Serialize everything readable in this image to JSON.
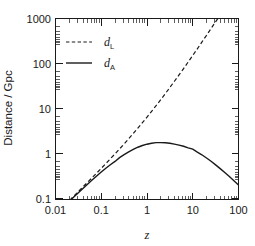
{
  "chart_data": {
    "type": "line",
    "title": "",
    "xlabel": "z",
    "ylabel": "Distance / Gpc",
    "xscale": "log",
    "yscale": "log",
    "xlim": [
      0.01,
      100
    ],
    "ylim": [
      0.04,
      1000
    ],
    "grid": false,
    "legend_position": "upper-left",
    "xticks": [
      0.01,
      0.1,
      1,
      10,
      100
    ],
    "xtick_labels": [
      "0.01",
      "0.1",
      "1",
      "10",
      "100"
    ],
    "yticks": [
      0.1,
      1,
      10,
      100,
      1000
    ],
    "ytick_labels": [
      "0.1",
      "1",
      "10",
      "100",
      "1000"
    ],
    "series": [
      {
        "name": "d_L",
        "label": "d",
        "label_sub": "L",
        "style": "dashed",
        "color": "#1a1a1a",
        "x": [
          0.01,
          0.0126,
          0.0158,
          0.02,
          0.0251,
          0.0316,
          0.0398,
          0.0501,
          0.0631,
          0.0794,
          0.1,
          0.126,
          0.158,
          0.2,
          0.251,
          0.316,
          0.398,
          0.501,
          0.631,
          0.794,
          1.0,
          1.26,
          1.58,
          2.0,
          2.51,
          3.16,
          3.98,
          5.01,
          6.31,
          7.94,
          10.0,
          12.6,
          15.8,
          20.0,
          25.1,
          31.6,
          39.8,
          50.1,
          63.1,
          79.4,
          100.0
        ],
        "y": [
          0.0447,
          0.0563,
          0.0709,
          0.0896,
          0.113,
          0.143,
          0.181,
          0.229,
          0.29,
          0.368,
          0.468,
          0.597,
          0.763,
          0.978,
          1.26,
          1.63,
          2.12,
          2.78,
          3.66,
          4.84,
          6.44,
          8.62,
          11.6,
          15.7,
          21.4,
          29.3,
          40.3,
          55.7,
          77.3,
          108.0,
          151.0,
          212.0,
          299.0,
          422.0,
          597.0,
          845.0,
          1197.0,
          1697.0,
          2406.0,
          3413.0,
          4843.0
        ]
      },
      {
        "name": "d_A",
        "label": "d",
        "label_sub": "A",
        "style": "solid",
        "color": "#1a1a1a",
        "x": [
          0.01,
          0.0126,
          0.0158,
          0.02,
          0.0251,
          0.0316,
          0.0398,
          0.0501,
          0.0631,
          0.0794,
          0.1,
          0.126,
          0.158,
          0.2,
          0.251,
          0.316,
          0.398,
          0.501,
          0.631,
          0.794,
          1.0,
          1.26,
          1.58,
          2.0,
          2.51,
          3.16,
          3.98,
          5.01,
          6.31,
          7.94,
          10.0,
          12.6,
          15.8,
          20.0,
          25.1,
          31.6,
          39.8,
          50.1,
          63.1,
          79.4,
          100.0
        ],
        "y": [
          0.0438,
          0.0549,
          0.0687,
          0.0861,
          0.1077,
          0.1343,
          0.1672,
          0.2076,
          0.2569,
          0.3166,
          0.3868,
          0.4691,
          0.5632,
          0.6669,
          0.8097,
          0.9408,
          1.084,
          1.233,
          1.379,
          1.504,
          1.61,
          1.69,
          1.744,
          1.742,
          1.74,
          1.693,
          1.614,
          1.539,
          1.446,
          1.334,
          1.248,
          1.071,
          0.9366,
          0.7957,
          0.671,
          0.5584,
          0.4617,
          0.3782,
          0.3076,
          0.2487,
          0.2005
        ],
        "peak": {
          "x": 1.6,
          "y": 1.8
        }
      }
    ]
  },
  "axes": {
    "y_title": "Distance / Gpc",
    "x_title": "z"
  },
  "legend": {
    "entries": [
      {
        "label": "d",
        "sub": "L",
        "style": "dashed"
      },
      {
        "label": "d",
        "sub": "A",
        "style": "solid"
      }
    ]
  }
}
